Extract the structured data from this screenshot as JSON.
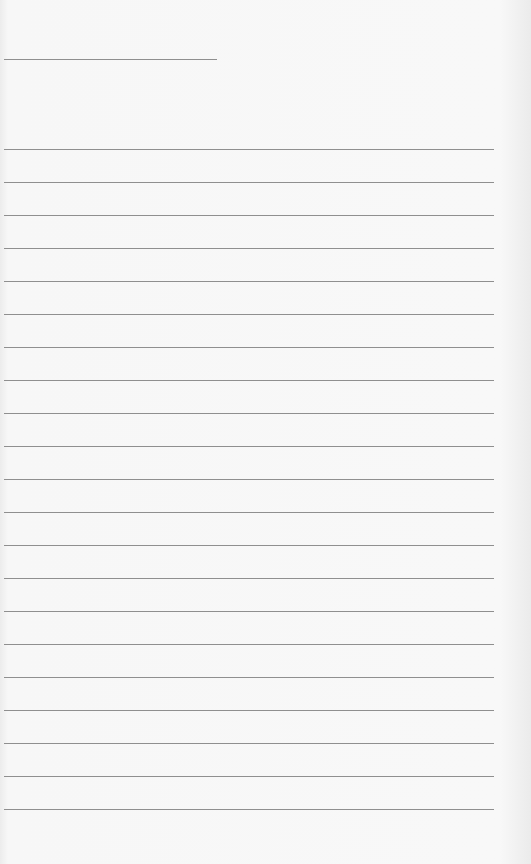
{
  "document": {
    "type": "lined-paper",
    "background_color": "#f7f7f7",
    "line_color": "#8f8f8f",
    "short_line": {
      "x": 4,
      "y": 59,
      "width": 213
    },
    "rules": {
      "x": 4,
      "width": 490,
      "start_y": 149,
      "spacing": 33,
      "count": 21
    }
  }
}
